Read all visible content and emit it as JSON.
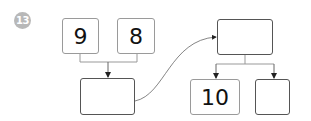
{
  "problem": {
    "number": "13"
  },
  "boxes": {
    "top_left": "9",
    "top_middle": "8",
    "sum_box": "",
    "target_box": "",
    "split_left": "10",
    "split_right": ""
  },
  "colors": {
    "badge": "#b8b8b8",
    "box_border_light": "#9a9a9a",
    "box_border_dark": "#555555",
    "connector": "#888888"
  }
}
